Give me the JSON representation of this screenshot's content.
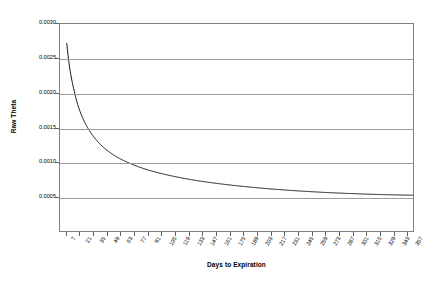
{
  "chart_data": {
    "type": "line",
    "title": "",
    "xlabel": "Days to Expiration",
    "ylabel": "Raw Theta",
    "xlim": [
      0,
      364
    ],
    "ylim": [
      0.0,
      0.003
    ],
    "grid": true,
    "legend": "none",
    "y_ticks": [
      0.003,
      0.0025,
      0.002,
      0.0015,
      0.001,
      0.0005
    ],
    "y_tick_labels": [
      "0.0030",
      "0.0025",
      "0.0020",
      "0.0015",
      "0.0010",
      "0.0005"
    ],
    "x_tick_labels": [
      "7",
      "21",
      "35",
      "49",
      "63",
      "77",
      "91",
      "105",
      "119",
      "133",
      "147",
      "161",
      "175",
      "189",
      "203",
      "217",
      "231",
      "245",
      "259",
      "273",
      "287",
      "301",
      "315",
      "329",
      "343",
      "357"
    ],
    "x": [
      7,
      14,
      21,
      28,
      35,
      42,
      49,
      56,
      63,
      70,
      77,
      91,
      105,
      119,
      133,
      147,
      161,
      175,
      189,
      203,
      217,
      231,
      245,
      259,
      273,
      287,
      301,
      315,
      329,
      343,
      357,
      364
    ],
    "series": [
      {
        "name": "Raw Theta",
        "color": "#000000",
        "values": [
          0.00272,
          0.00207,
          0.00172,
          0.00151,
          0.00136,
          0.00125,
          0.001165,
          0.001095,
          0.00104,
          0.000993,
          0.000952,
          0.000884,
          0.000831,
          0.000787,
          0.00075,
          0.000718,
          0.000691,
          0.000667,
          0.000646,
          0.000627,
          0.00061,
          0.000595,
          0.000582,
          0.00057,
          0.000559,
          0.00055,
          0.000542,
          0.000535,
          0.000529,
          0.000524,
          0.00052,
          0.000518
        ]
      }
    ]
  }
}
